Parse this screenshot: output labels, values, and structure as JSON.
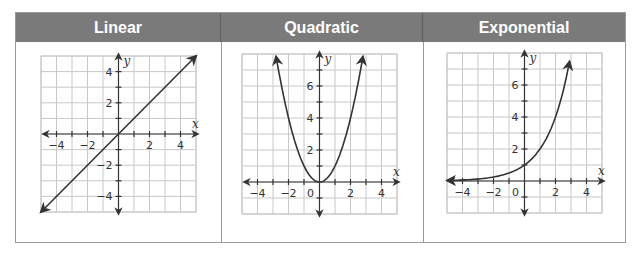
{
  "table": {
    "headers": [
      "Linear",
      "Quadratic",
      "Exponential"
    ],
    "header_bg": "#7a7a7a",
    "header_text_color": "#ffffff"
  },
  "chart_data": [
    {
      "type": "line",
      "title": "Linear",
      "function": "y = x",
      "xlabel": "x",
      "ylabel": "y",
      "xlim": [
        -5,
        5
      ],
      "ylim": [
        -5,
        5
      ],
      "grid": true,
      "x_tick_labels": [
        "-4",
        "-2",
        "2",
        "4"
      ],
      "y_tick_labels": [
        "4",
        "2",
        "-2",
        "-4"
      ],
      "points": [
        [
          -5,
          -5
        ],
        [
          0,
          0
        ],
        [
          5,
          5
        ]
      ],
      "arrows_both_ends": true
    },
    {
      "type": "line",
      "title": "Quadratic",
      "function": "y = x^2",
      "xlabel": "x",
      "ylabel": "y",
      "xlim": [
        -5,
        5
      ],
      "ylim": [
        -2,
        8
      ],
      "grid": true,
      "x_tick_labels": [
        "-4",
        "-2",
        "0",
        "2",
        "4"
      ],
      "y_tick_labels": [
        "6",
        "4",
        "2"
      ],
      "points": [
        [
          -2.8,
          7.84
        ],
        [
          -2,
          4
        ],
        [
          -1,
          1
        ],
        [
          0,
          0
        ],
        [
          1,
          1
        ],
        [
          2,
          4
        ],
        [
          2.8,
          7.84
        ]
      ],
      "arrows_both_ends": true
    },
    {
      "type": "line",
      "title": "Exponential",
      "function": "y = 2^x",
      "xlabel": "x",
      "ylabel": "y",
      "xlim": [
        -5,
        5
      ],
      "ylim": [
        -2,
        8
      ],
      "grid": true,
      "x_tick_labels": [
        "-4",
        "-2",
        "0",
        "2",
        "4"
      ],
      "y_tick_labels": [
        "6",
        "4",
        "2"
      ],
      "points": [
        [
          -5,
          0.03
        ],
        [
          -2,
          0.25
        ],
        [
          0,
          1
        ],
        [
          1,
          2
        ],
        [
          2,
          4
        ],
        [
          2.95,
          7.7
        ]
      ],
      "arrows_both_ends": true
    }
  ]
}
